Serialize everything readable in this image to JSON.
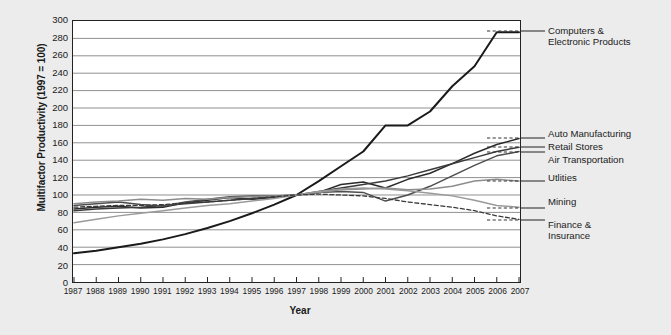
{
  "chart_data": {
    "type": "line",
    "title": "",
    "xlabel": "Year",
    "ylabel": "Multifactor Productivity (1997 = 100)",
    "ylim": [
      0,
      300
    ],
    "ytick_step": 20,
    "yticks": [
      300,
      280,
      260,
      240,
      220,
      200,
      180,
      160,
      140,
      120,
      100,
      80,
      60,
      40,
      20,
      0
    ],
    "grid": true,
    "legend_position": "right-of-axes (series end labels with dashed leader lines)",
    "x": [
      1987,
      1988,
      1989,
      1990,
      1991,
      1992,
      1993,
      1994,
      1995,
      1996,
      1997,
      1998,
      1999,
      2000,
      2001,
      2002,
      2003,
      2004,
      2005,
      2006,
      2007
    ],
    "xtick_labels": [
      "1987",
      "1988",
      "1989",
      "1990",
      "1991",
      "1992",
      "1993",
      "1994",
      "1995",
      "1996",
      "1997",
      "1998",
      "1999",
      "2000",
      "2001",
      "2002",
      "2003",
      "2004",
      "2005",
      "2006",
      "2007"
    ],
    "series": [
      {
        "name": "Computers & Electronic Products",
        "color": "#1a1a1a",
        "width": 2.0,
        "values": [
          33,
          36,
          40,
          44,
          49,
          55,
          62,
          70,
          79,
          89,
          100,
          116,
          133,
          150,
          180,
          180,
          196,
          225,
          248,
          287,
          287
        ]
      },
      {
        "name": "Auto Manufacturing",
        "color": "#2b2b2b",
        "width": 1.5,
        "values": [
          84,
          86,
          87,
          85,
          86,
          91,
          94,
          97,
          95,
          97,
          100,
          103,
          112,
          115,
          108,
          118,
          125,
          136,
          148,
          158,
          165
        ]
      },
      {
        "name": "Retail Stores",
        "color": "#3a3a3a",
        "width": 1.5,
        "values": [
          82,
          84,
          85,
          86,
          88,
          90,
          92,
          94,
          96,
          98,
          100,
          104,
          108,
          112,
          116,
          122,
          129,
          136,
          143,
          150,
          155
        ]
      },
      {
        "name": "Air Transportation",
        "color": "#4d4d4d",
        "width": 1.5,
        "values": [
          88,
          90,
          92,
          89,
          87,
          92,
          95,
          98,
          99,
          99,
          100,
          103,
          104,
          103,
          93,
          100,
          110,
          122,
          134,
          145,
          150
        ]
      },
      {
        "name": "Utlities",
        "color": "#8c8c8c",
        "width": 1.5,
        "values": [
          90,
          92,
          93,
          95,
          94,
          96,
          95,
          97,
          98,
          99,
          100,
          103,
          106,
          107,
          108,
          106,
          107,
          110,
          116,
          118,
          116
        ]
      },
      {
        "name": "Mining",
        "color": "#9a9a9a",
        "width": 1.5,
        "values": [
          68,
          72,
          76,
          79,
          82,
          85,
          88,
          90,
          93,
          96,
          100,
          104,
          107,
          108,
          107,
          105,
          102,
          99,
          94,
          88,
          86
        ]
      },
      {
        "name": "Finance & Insurance",
        "color": "#3a3a3a",
        "width": 1.3,
        "dashed": true,
        "values": [
          86,
          87,
          88,
          88,
          89,
          91,
          92,
          94,
          96,
          98,
          100,
          101,
          100,
          99,
          96,
          92,
          89,
          86,
          82,
          76,
          72
        ]
      }
    ],
    "end_labels": [
      {
        "text": "Computers &\nElectronic Products",
        "value": 287,
        "top": 25
      },
      {
        "text": "Auto Manufacturing",
        "value": 165,
        "top": 128
      },
      {
        "text": "Retail Stores",
        "value": 155,
        "top": 141
      },
      {
        "text": "Air Transportation",
        "value": 150,
        "top": 154
      },
      {
        "text": "Utlities",
        "value": 116,
        "top": 172
      },
      {
        "text": "Mining",
        "value": 86,
        "top": 196
      },
      {
        "text": "Finance &\nInsurance",
        "value": 72,
        "top": 219
      }
    ]
  },
  "style": {
    "background": "#ececec",
    "plot_background": "#ffffff",
    "frame_color": "#222222",
    "grid_color": "#8f8f8f"
  }
}
